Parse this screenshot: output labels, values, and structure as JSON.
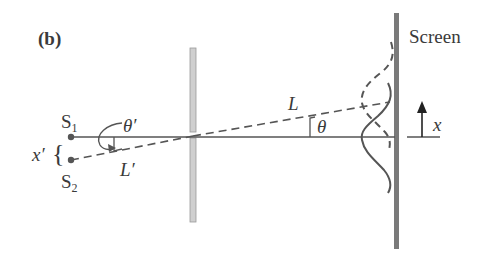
{
  "figure": {
    "panel_label": "(b)",
    "screen_label": "Screen",
    "source_labels": {
      "s1_base": "S",
      "s1_sub": "1",
      "s2_base": "S",
      "s2_sub": "2"
    },
    "source_separation_label": "x′",
    "brace": "{",
    "theta_prime_label": "θ′",
    "l_prime_label": "L′",
    "l_label": "L",
    "theta_label": "θ",
    "x_axis_label": "x"
  },
  "colors": {
    "line": "#555555",
    "barrier_fill": "#cccccc",
    "screen_fill": "#7a7a7a",
    "text": "#3a3a3a"
  }
}
